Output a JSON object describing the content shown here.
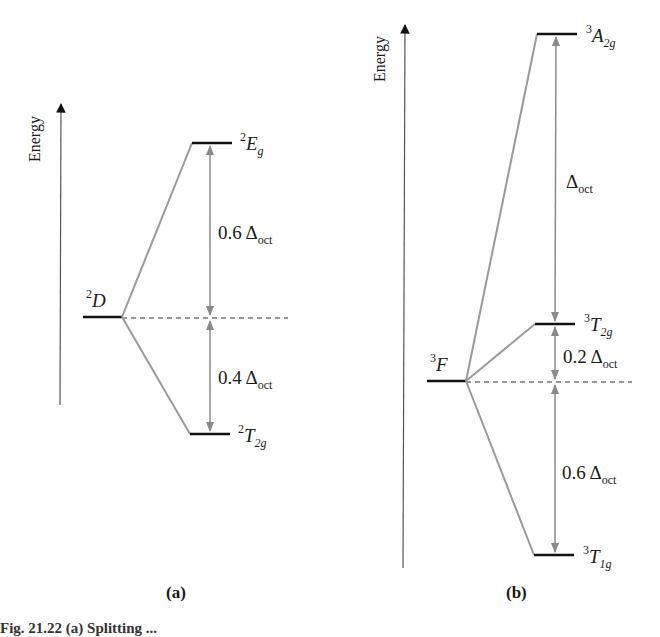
{
  "diagram": {
    "panels": [
      {
        "id": "a",
        "label": "(a)",
        "axis_label": "Energy",
        "parent_term": {
          "sup": "2",
          "letter": "D"
        },
        "levels": [
          {
            "sup": "2",
            "letter": "E",
            "sub": "g",
            "gap_label": "0.6 Δ",
            "gap_sub": "oct"
          },
          {
            "sup": "2",
            "letter": "T",
            "sub": "2g",
            "gap_label": "0.4 Δ",
            "gap_sub": "oct"
          }
        ]
      },
      {
        "id": "b",
        "label": "(b)",
        "axis_label": "Energy",
        "parent_term": {
          "sup": "3",
          "letter": "F"
        },
        "levels": [
          {
            "sup": "3",
            "letter": "A",
            "sub": "2g",
            "gap_label": "Δ",
            "gap_sub": "oct"
          },
          {
            "sup": "3",
            "letter": "T",
            "sub": "2g",
            "gap_label": "0.2 Δ",
            "gap_sub": "oct"
          },
          {
            "sup": "3",
            "letter": "T",
            "sub": "1g",
            "gap_label": "0.6 Δ",
            "gap_sub": "oct"
          }
        ]
      }
    ],
    "caption": "Fig. 21.22 (a) Splitting ..."
  },
  "colors": {
    "level": "#111111",
    "connector": "#9a9a9a",
    "arrow": "#8a8a8a",
    "axis": "#555555"
  }
}
